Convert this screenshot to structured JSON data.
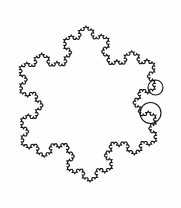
{
  "figure": {
    "type": "fractal-curve",
    "background_color": "#fefefe",
    "stroke_color": "#1a1a1a",
    "stroke_width": 1.15,
    "canvas": {
      "width": 181,
      "height": 208
    }
  },
  "fractal": {
    "name": "Koch snowflake",
    "base_shape": "equilateral-triangle",
    "iterations": 4,
    "segments_per_side": 64,
    "total_segments": 192,
    "seed_triangle": {
      "center_x": 88,
      "center_y": 104,
      "circumradius": 78,
      "rotation_degrees": -91.5
    },
    "bounding_box": {
      "left": 13,
      "top": 12,
      "right": 172,
      "bottom": 196
    },
    "vertices": {
      "top": [
        91,
        12
      ],
      "left": [
        13,
        115
      ],
      "bottom": [
        91,
        196
      ],
      "right": [
        172,
        104
      ]
    }
  },
  "annotations": {
    "label": "self-similarity magnifier circles",
    "circles": [
      {
        "name": "upper-zoom-circle",
        "cx": 155.5,
        "cy": 87.5,
        "r": 7.5
      },
      {
        "name": "lower-zoom-circle",
        "cx": 150.5,
        "cy": 113.0,
        "r": 10.5
      }
    ]
  },
  "chart_data": {
    "type": "line",
    "xlabel": "",
    "ylabel": "",
    "xlim": [
      13,
      172
    ],
    "ylim": [
      12,
      196
    ],
    "grid": false,
    "legend": "none",
    "series": [
      {
        "name": "koch-snowflake-outline",
        "iterations": 4,
        "closed": true,
        "color": "#1a1a1a"
      }
    ],
    "annotations": [
      {
        "type": "circle",
        "cx": 155.5,
        "cy": 87.5,
        "r": 7.5
      },
      {
        "type": "circle",
        "cx": 150.5,
        "cy": 113.0,
        "r": 10.5
      }
    ]
  }
}
